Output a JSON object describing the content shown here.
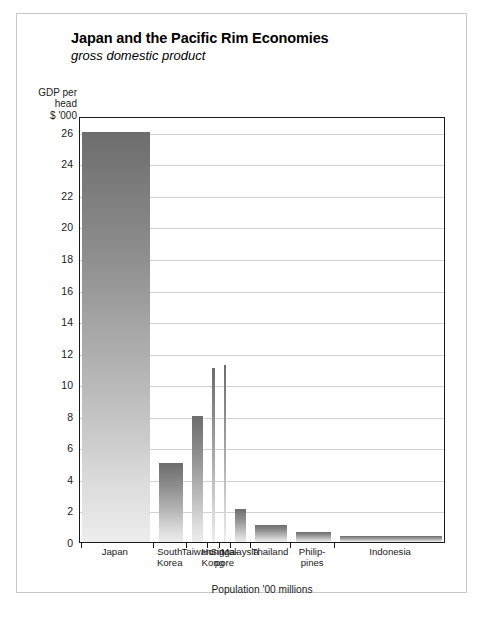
{
  "figure": {
    "title": "Japan and the Pacific Rim Economies",
    "subtitle": "gross domestic product",
    "y_axis_caption_line1": "GDP per",
    "y_axis_caption_line2": "head",
    "y_axis_caption_line3": "$ '000",
    "x_axis_title": "Population '00 millions",
    "frame_color": "#1a1a1a",
    "grid_color": "#d2d2d2",
    "bar_top_color": "#6d6d6d",
    "bar_bottom_color": "#ededed"
  },
  "chart_data": {
    "type": "bar",
    "title": "Japan and the Pacific Rim Economies",
    "subtitle": "gross domestic product",
    "xlabel": "Population '00 millions",
    "ylabel": "GDP per head $ '000",
    "ylim": [
      0,
      27
    ],
    "yticks": [
      0,
      2,
      4,
      6,
      8,
      10,
      12,
      14,
      16,
      18,
      20,
      22,
      24,
      26
    ],
    "ytick_labels": [
      "0",
      "2",
      "4",
      "6",
      "8",
      "10",
      "12",
      "14",
      "16",
      "18",
      "20",
      "22",
      "24",
      "26"
    ],
    "grid": true,
    "legend": "none",
    "note": "Bar width encodes population ('00 millions); bar height encodes GDP per head ($ '000).",
    "categories": [
      "Japan",
      "South Korea",
      "Taiwan",
      "Hong Kong",
      "Singapore",
      "Malaysia",
      "Thailand",
      "Philippines",
      "Indonesia"
    ],
    "category_label_lines": [
      [
        "Japan"
      ],
      [
        "South",
        "Korea"
      ],
      [
        "Taiwan"
      ],
      [
        "Hong",
        "Kong"
      ],
      [
        "Singa-",
        "pore"
      ],
      [
        "Malaysia"
      ],
      [
        "Thailand"
      ],
      [
        "Philip-",
        "pines"
      ],
      [
        "Indonesia"
      ]
    ],
    "values": [
      26,
      5,
      8,
      11,
      11.2,
      2.1,
      1.1,
      0.65,
      0.35
    ],
    "widths": [
      1.25,
      0.45,
      0.21,
      0.06,
      0.03,
      0.2,
      0.58,
      0.65,
      1.9
    ],
    "series": [
      {
        "name": "GDP per head ($ '000)",
        "values": [
          26,
          5,
          8,
          11,
          11.2,
          2.1,
          1.1,
          0.65,
          0.35
        ]
      }
    ]
  },
  "bars": [
    {
      "name": "Japan",
      "value": 26,
      "left_px": 2,
      "width_px": 32
    },
    {
      "name": "South Korea",
      "value": 5,
      "left_px": 74,
      "width_px": 5
    },
    {
      "name": "Taiwan",
      "value": 8,
      "left_px": 131,
      "width_px": 4
    },
    {
      "name": "Hong Kong",
      "value": 11,
      "left_px": 186,
      "width_px": 2
    },
    {
      "name": "Singapore",
      "value": 11.2,
      "left_px": 246,
      "width_px": 2
    },
    {
      "name": "Malaysia",
      "value": 2.1,
      "left_px": 241,
      "width_px": 0
    },
    {
      "name": "Thailand",
      "value": 1.1,
      "left_px": 258,
      "width_px": 0
    },
    {
      "name": "Philippines",
      "value": 0.65,
      "left_px": 0,
      "width_px": 0
    },
    {
      "name": "Indonesia",
      "value": 0.35,
      "left_px": 0,
      "width_px": 0
    }
  ]
}
